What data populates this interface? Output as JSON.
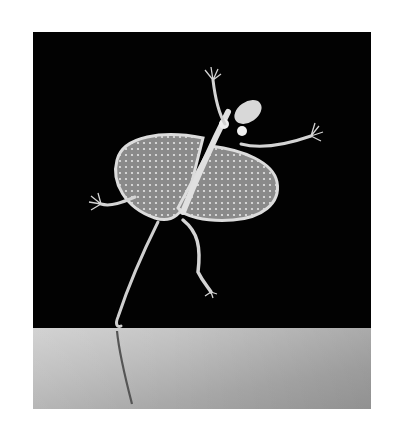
{
  "image": {
    "subject": "Flying lizard (Draco) gliding with outstretched patagium wings",
    "style": "black and white photograph",
    "background_color": "#020202",
    "floor_color_light": "#cfcfcf",
    "floor_color_dark": "#9d9d9d",
    "lizard_color": "#d8d8d8"
  }
}
